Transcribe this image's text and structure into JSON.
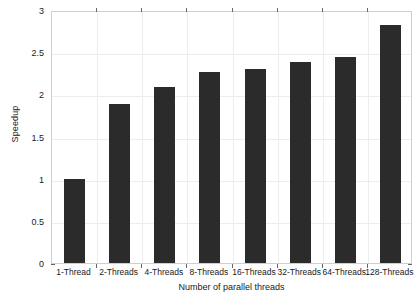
{
  "chart_data": {
    "type": "bar",
    "title": "",
    "xlabel": "Number of parallel threads",
    "ylabel": "Speedup",
    "categories": [
      "1-Thread",
      "2-Threads",
      "4-Threads",
      "8-Threads",
      "16-Threads",
      "32-Threads",
      "64-Threads",
      "128-Threads"
    ],
    "values": [
      1.0,
      1.88,
      2.09,
      2.26,
      2.3,
      2.38,
      2.44,
      2.82
    ],
    "series": [
      {
        "name": "Speedup",
        "values": [
          1.0,
          1.88,
          2.09,
          2.26,
          2.3,
          2.38,
          2.44,
          2.82
        ]
      }
    ],
    "ylim": [
      0,
      3
    ],
    "yticks": [
      0,
      0.5,
      1,
      1.5,
      2,
      2.5,
      3
    ],
    "ytick_labels": [
      "0",
      "0.5",
      "1",
      "1.5",
      "2",
      "2.5",
      "3"
    ],
    "grid": true,
    "grid_axis": "both",
    "legend": false,
    "legend_position": "none",
    "bar_color": "#2b2b2b",
    "background_color": "#ffffff",
    "grid_color": "#ededed",
    "axis_color": "#cfcfcf",
    "text_color": "#1a1a1a"
  }
}
